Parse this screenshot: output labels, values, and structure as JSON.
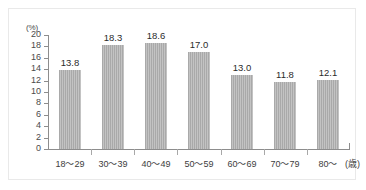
{
  "chart_data": {
    "type": "bar",
    "title": "",
    "subtitle": "",
    "xlabel": "(歳)",
    "ylabel": "(%)",
    "categories": [
      "18～29",
      "30～39",
      "40～49",
      "50～59",
      "60～69",
      "70～79",
      "80～"
    ],
    "values": [
      13.8,
      18.3,
      18.6,
      17.0,
      13.0,
      11.8,
      12.1
    ],
    "value_labels": [
      "13.8",
      "18.3",
      "18.6",
      "17.0",
      "13.0",
      "11.8",
      "12.1"
    ],
    "ylim": [
      0,
      20
    ],
    "ytick_labels": [
      "20",
      "18",
      "16",
      "14",
      "12",
      "10",
      "8",
      "6",
      "4",
      "2",
      "0"
    ],
    "ytick_values": [
      20,
      18,
      16,
      14,
      12,
      10,
      8,
      6,
      4,
      2,
      0
    ],
    "grid": false,
    "legend": null,
    "legend_position": "none",
    "colors": {
      "bar_fill": "#a9a9a9",
      "axis_line": "#8d8d8d",
      "frame_border": "#e9e9e9",
      "text": "#3d3d3d",
      "background": "#ffffff"
    }
  }
}
